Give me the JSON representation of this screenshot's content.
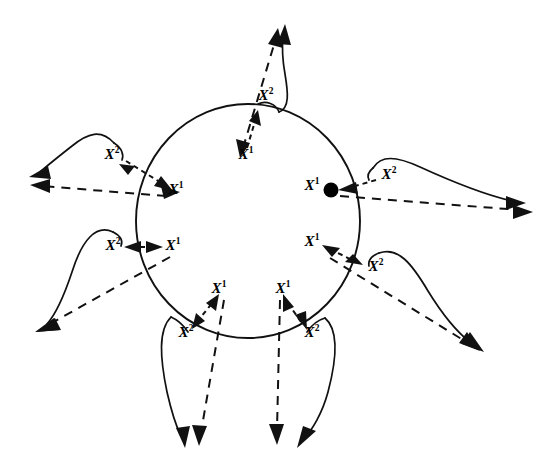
{
  "figure": {
    "background_color": "#ffffff",
    "ink_color": "#111111",
    "label_superscript_1": "1",
    "label_superscript_2": "2",
    "label_base": "X",
    "circle": {
      "center_x": 248,
      "center_y": 221,
      "radius_x": 112,
      "radius_y": 117
    },
    "marker_dot": {
      "name": "filled-state-dot",
      "cx": 331,
      "cy": 190,
      "r": 7.5,
      "color": "#000000"
    },
    "spokes": [
      {
        "id": "top",
        "angle_deg": -80,
        "x2_label": "X",
        "x2_sup": "2",
        "x2_x": 266,
        "x2_y": 97,
        "x1_label": "X",
        "x1_sup": "1",
        "x1_x": 246,
        "x1_y": 156
      },
      {
        "id": "upper-left",
        "angle_deg": 197,
        "x2_label": "X",
        "x2_sup": "2",
        "x2_x": 112,
        "x2_y": 156,
        "x1_label": "X",
        "x1_sup": "1",
        "x1_x": 176,
        "x1_y": 191
      },
      {
        "id": "right",
        "angle_deg": -14,
        "x2_label": "X",
        "x2_sup": "2",
        "x2_x": 389,
        "x2_y": 176,
        "x1_label": "X",
        "x1_sup": "1",
        "x1_x": 312,
        "x1_y": 187
      },
      {
        "id": "lower-left",
        "angle_deg": 205,
        "x2_label": "X",
        "x2_sup": "2",
        "x2_x": 113,
        "x2_y": 247,
        "x1_label": "X",
        "x1_sup": "1",
        "x1_x": 173,
        "x1_y": 247
      },
      {
        "id": "lower-right",
        "angle_deg": 36,
        "x2_label": "X",
        "x2_sup": "2",
        "x2_x": 376,
        "x2_y": 268,
        "x1_label": "X",
        "x1_sup": "1",
        "x1_x": 312,
        "x1_y": 243
      },
      {
        "id": "bottom-left",
        "angle_deg": 103,
        "x2_label": "X",
        "x2_sup": "2",
        "x2_x": 186,
        "x2_y": 334,
        "x1_label": "X",
        "x1_sup": "1",
        "x1_x": 219,
        "x1_y": 290
      },
      {
        "id": "bottom-right",
        "angle_deg": 77,
        "x2_label": "X",
        "x2_sup": "2",
        "x2_x": 312,
        "x2_y": 334,
        "x1_label": "X",
        "x1_sup": "1",
        "x1_x": 283,
        "x1_y": 290
      }
    ]
  }
}
